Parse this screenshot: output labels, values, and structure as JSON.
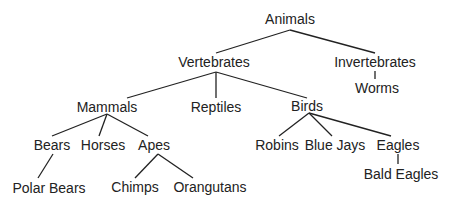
{
  "diagram": {
    "type": "tree",
    "line_color": "#222222",
    "nodes": {
      "animals": "Animals",
      "vertebrates": "Vertebrates",
      "invertebrates": "Invertebrates",
      "worms": "Worms",
      "mammals": "Mammals",
      "reptiles": "Reptiles",
      "birds": "Birds",
      "bears": "Bears",
      "horses": "Horses",
      "apes": "Apes",
      "robins": "Robins",
      "blue_jays": "Blue Jays",
      "eagles": "Eagles",
      "polar_bears": "Polar Bears",
      "chimps": "Chimps",
      "orangutans": "Orangutans",
      "bald_eagles": "Bald Eagles"
    },
    "edges": [
      [
        "animals",
        "vertebrates"
      ],
      [
        "animals",
        "invertebrates"
      ],
      [
        "invertebrates",
        "worms"
      ],
      [
        "vertebrates",
        "mammals"
      ],
      [
        "vertebrates",
        "reptiles"
      ],
      [
        "vertebrates",
        "birds"
      ],
      [
        "mammals",
        "bears"
      ],
      [
        "mammals",
        "horses"
      ],
      [
        "mammals",
        "apes"
      ],
      [
        "birds",
        "robins"
      ],
      [
        "birds",
        "blue_jays"
      ],
      [
        "birds",
        "eagles"
      ],
      [
        "bears",
        "polar_bears"
      ],
      [
        "apes",
        "chimps"
      ],
      [
        "apes",
        "orangutans"
      ],
      [
        "eagles",
        "bald_eagles"
      ]
    ]
  }
}
